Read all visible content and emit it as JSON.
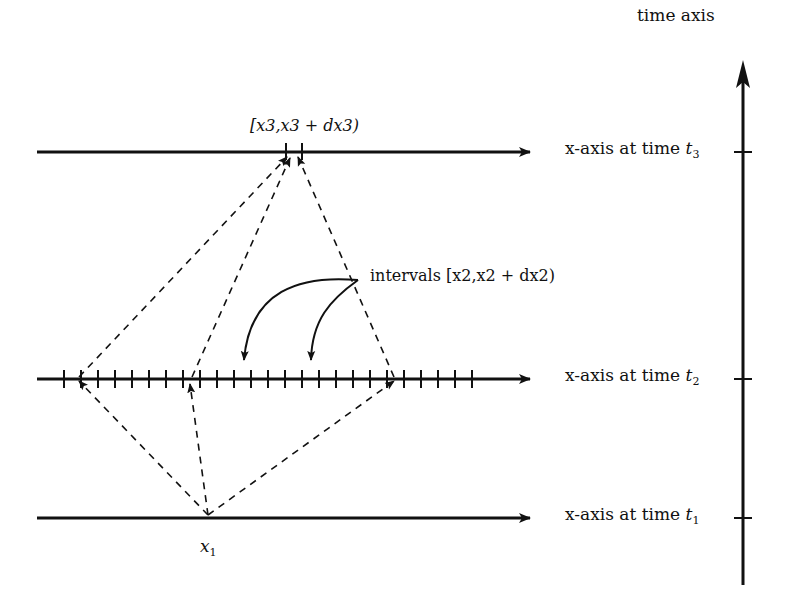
{
  "diagram": {
    "time_axis": {
      "label": "time axis"
    },
    "rows": [
      {
        "id": "t3",
        "label_prefix": "x-axis at time ",
        "time_symbol": "t",
        "time_sub": "3"
      },
      {
        "id": "t2",
        "label_prefix": "x-axis at time ",
        "time_symbol": "t",
        "time_sub": "2"
      },
      {
        "id": "t1",
        "label_prefix": "x-axis at time ",
        "time_symbol": "t",
        "time_sub": "1"
      }
    ],
    "interval_x3": {
      "text": "[x3,x3 + dx3)"
    },
    "intervals_x2": {
      "text": "intervals [x2,x2 + dx2)"
    },
    "point_x1": {
      "symbol": "x",
      "sub": "1"
    },
    "colors": {
      "ink": "#111111",
      "background": "#ffffff"
    }
  }
}
